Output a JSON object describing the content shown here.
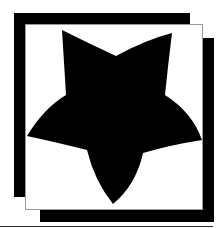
{
  "graphic": {
    "subject": "five-pointed-star",
    "colors": {
      "background": "#ffffff",
      "star_fill": "#000000",
      "frame_fill": "#000000",
      "card_fill": "#ffffff",
      "card_border": "#9a9a9a",
      "rule_color": "#333333"
    },
    "star_points": {
      "top_left_tip": [
        62,
        30
      ],
      "top_notch": [
        116,
        56
      ],
      "top_right_tip": [
        172,
        33
      ],
      "upper_right_notch": [
        165,
        95
      ],
      "right_tip": [
        202,
        140
      ],
      "lower_right_notch": [
        143,
        153
      ],
      "bottom_tip": [
        113,
        204
      ],
      "lower_left_notch": [
        87,
        150
      ],
      "left_tip": [
        27,
        136
      ],
      "upper_left_notch": [
        66,
        95
      ]
    }
  }
}
